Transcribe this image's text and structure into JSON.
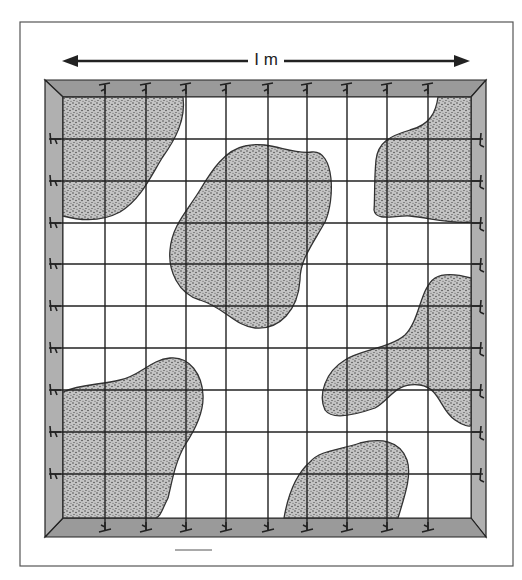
{
  "figure": {
    "type": "quadrat-sampling-diagram",
    "scale_label": "I m",
    "scale_arrow": {
      "x1": 62,
      "x2": 470,
      "y": 61
    },
    "outer_box": {
      "x": 20,
      "y": 22,
      "width": 493,
      "height": 544
    },
    "caption_dash": {
      "x1": 175,
      "x2": 212,
      "y": 550
    },
    "frame": {
      "outer": {
        "x1": 45,
        "y1": 80,
        "x2": 486,
        "y2": 537
      },
      "inner": {
        "x1": 63,
        "y1": 97,
        "x2": 471,
        "y2": 518
      },
      "frame_color": "#a6a6a6",
      "frame_top_color": "#9a9a9a",
      "frame_side_color": "#b0b0b0"
    },
    "grid": {
      "vertical_x": [
        105,
        146,
        186,
        226,
        268,
        307,
        347,
        387,
        428
      ],
      "horizontal_y": [
        139,
        181,
        223,
        264,
        306,
        348,
        390,
        432,
        474
      ],
      "line_color": "#222222"
    },
    "patches": {
      "fill_color": "#bdbdbd",
      "stroke_color": "#333333",
      "shapes": [
        {
          "name": "top-left-patch",
          "path": "M63,97 L183,97 C186,120 175,140 162,158 C150,178 140,200 120,212 C105,220 85,222 63,216 Z"
        },
        {
          "name": "center-patch",
          "path": "M245,146 C270,140 290,155 312,152 C335,150 335,200 325,222 C312,245 300,260 300,280 C298,310 280,330 255,328 C235,326 225,308 200,300 C178,294 168,270 170,250 C172,225 188,210 200,190 C212,170 225,150 245,146 Z"
        },
        {
          "name": "top-right-patch",
          "path": "M471,97 L438,97 C436,112 430,125 410,130 C390,136 378,142 376,160 C374,180 375,200 374,210 C376,222 395,215 410,216 C430,218 450,224 471,222 Z"
        },
        {
          "name": "right-middle-patch",
          "path": "M471,278 C460,275 445,272 435,278 C420,288 420,320 405,335 C390,348 360,350 345,360 C325,372 318,395 325,410 C332,420 355,415 375,408 C390,400 395,382 420,385 C440,388 440,410 455,420 C462,425 471,428 471,425 Z"
        },
        {
          "name": "bottom-left-patch",
          "path": "M63,392 C80,384 100,385 120,380 C140,376 150,360 170,358 C190,356 202,375 203,395 C204,412 195,430 185,445 C175,462 172,482 168,498 C162,510 160,518 155,518 L63,518 Z"
        },
        {
          "name": "bottom-center-patch",
          "path": "M284,518 C288,495 295,475 310,462 C320,450 340,450 360,443 C380,438 400,440 407,460 C412,475 405,495 398,518 Z"
        }
      ]
    },
    "pins": {
      "color": "#222222",
      "top_x": [
        105,
        146,
        186,
        226,
        268,
        307,
        347,
        387,
        428
      ],
      "bottom_x": [
        105,
        146,
        186,
        226,
        268,
        307,
        347,
        387,
        428
      ],
      "left_y": [
        139,
        181,
        223,
        264,
        306,
        348,
        390,
        432,
        474
      ],
      "right_y": [
        139,
        181,
        223,
        264,
        306,
        348,
        390,
        432,
        474
      ]
    }
  }
}
